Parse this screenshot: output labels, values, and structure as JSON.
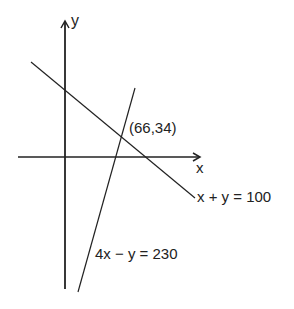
{
  "diagram": {
    "axes": {
      "x_label": "x",
      "y_label": "y"
    },
    "lines": [
      {
        "equation": "x + y = 100"
      },
      {
        "equation": "4x − y = 230"
      }
    ],
    "intersection": {
      "label": "(66,34)",
      "x": 66,
      "y": 34
    },
    "colors": {
      "stroke": "#222222",
      "background": "#ffffff"
    }
  }
}
